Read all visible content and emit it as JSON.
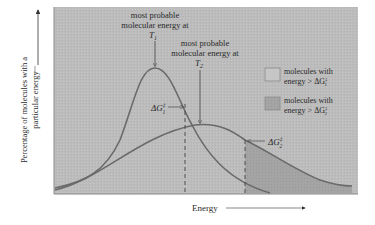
{
  "figure": {
    "y_axis_label_line1": "Percentage of molecules with a",
    "y_axis_label_line2": "particular energy",
    "x_axis_label": "Energy",
    "annotation_t1_line1": "most probable",
    "annotation_t1_line2": "molecular energy at",
    "annotation_t1_temp": "T",
    "annotation_t1_sub": "1",
    "annotation_t2_line1": "most probable",
    "annotation_t2_line2": "molecular energy at",
    "annotation_t2_temp": "T",
    "annotation_t2_sub": "2",
    "dg1_label": "ΔG",
    "dg1_sup": "‡",
    "dg1_sub": "1",
    "dg2_label": "ΔG",
    "dg2_sup": "‡",
    "dg2_sub": "2",
    "legend": [
      {
        "line1": "molecules with",
        "line2": "energy > ΔG",
        "sup": "‡",
        "sub": "1",
        "swatch": "#c4c4c4"
      },
      {
        "line1": "molecules with",
        "line2": "energy > ΔG",
        "sup": "‡",
        "sub": "2",
        "swatch": "#9c9c9c"
      }
    ],
    "colors": {
      "plot_bg": "#bdbdbd",
      "curve": "#6e6e6e",
      "shade_dg2": "#a2a2a2",
      "dashed": "#4a4a4a"
    }
  }
}
